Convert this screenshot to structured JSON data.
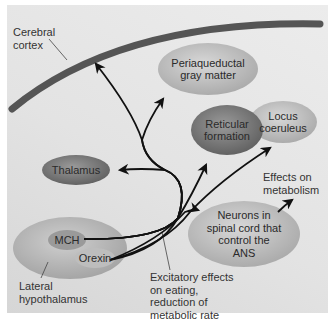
{
  "diagram": {
    "labels": {
      "cerebral_cortex": "Cerebral\ncortex",
      "lateral_hypothalamus": "Lateral\nhypothalamus",
      "excitatory_effects": "Excitatory effects\non eating,\nreduction of\nmetabolic rate",
      "effects_on_metabolism": "Effects on\nmetabolism"
    },
    "nodes": {
      "periaqueductal": "Periaqueductal\ngray matter",
      "locus": "Locus\ncoeruleus",
      "reticular": "Reticular\nformation",
      "thalamus": "Thalamus",
      "neurons": "Neurons in\nspinal cord that\ncontrol the\nANS",
      "mch": "MCH",
      "orexin": "Orexin"
    },
    "colors": {
      "panel": "#e3e3e3",
      "cortex_band": "#555555",
      "dark_node": "#7a7a7a",
      "light_node": "#c4c4c4",
      "arrow": "#111111"
    }
  }
}
